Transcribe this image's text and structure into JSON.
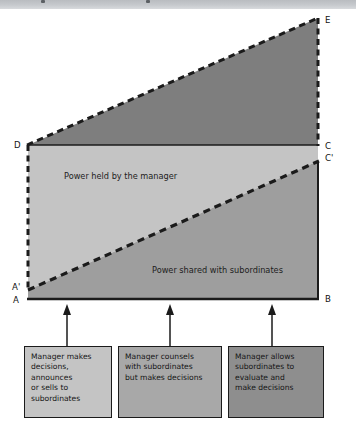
{
  "figure": {
    "regions": [
      {
        "id": "manager-power",
        "label": "Power held by the manager"
      },
      {
        "id": "shared-power",
        "label": "Power shared with subordinates"
      }
    ],
    "vertices": [
      {
        "id": "A",
        "label": "A"
      },
      {
        "id": "A-prime",
        "label": "A'"
      },
      {
        "id": "B",
        "label": "B"
      },
      {
        "id": "C",
        "label": "C"
      },
      {
        "id": "C-prime",
        "label": "C'"
      },
      {
        "id": "D",
        "label": "D"
      },
      {
        "id": "E",
        "label": "E"
      }
    ],
    "captions": [
      {
        "id": "tells",
        "lines": [
          "Manager makes",
          "decisions,",
          "announces",
          "or sells to",
          "subordinates"
        ]
      },
      {
        "id": "consults",
        "lines": [
          "Manager counsels",
          "with subordinates",
          "but makes decisions"
        ]
      },
      {
        "id": "delegates",
        "lines": [
          "Manager allows",
          "subordinates to",
          "evaluate and",
          "make decisions"
        ]
      }
    ],
    "colors": {
      "upper_triangle": "#7e7e7e",
      "manager_region": "#c4c4c4",
      "shared_region": "#9e9e9e",
      "caption_light": "#c4c4c4",
      "caption_medium": "#a8a8a8",
      "caption_dark": "#8e8e8e",
      "outline": "#1b1b1b",
      "banner": "#c6c9cd"
    }
  }
}
